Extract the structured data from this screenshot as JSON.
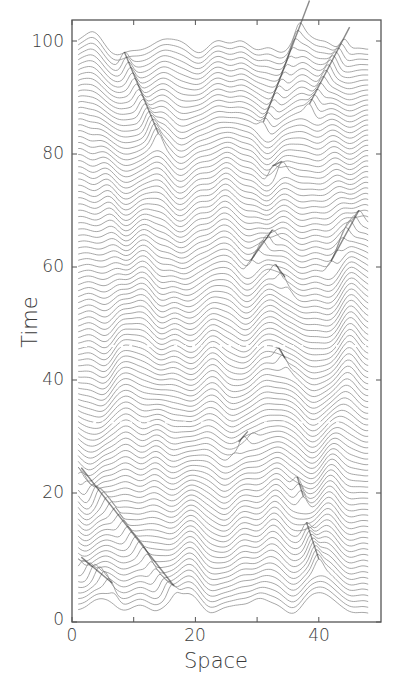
{
  "chart_data": {
    "type": "line",
    "subtype": "waterfall",
    "title": "",
    "xlabel": "Space",
    "ylabel": "Time",
    "xlim": [
      0,
      50
    ],
    "ylim": [
      0,
      103
    ],
    "xticks": [
      0,
      10,
      20,
      30,
      40
    ],
    "xtick_labels": [
      "0",
      "20",
      "40"
    ],
    "xtick_labeled_values": [
      0,
      20,
      40
    ],
    "yticks": [
      0,
      20,
      40,
      60,
      80,
      100
    ],
    "ytick_labels": [
      "0",
      "20",
      "40",
      "60",
      "80",
      "100"
    ],
    "grid": false,
    "legend": null,
    "n_traces": 100,
    "trace_spacing_time": 1,
    "trace_x_range": [
      1,
      48
    ],
    "trace_color": "#8a8a8a",
    "soliton_color": "#2a2a2a",
    "frame_color": "#555555",
    "waves": [
      {
        "name": "crest-a",
        "x0": 5.5,
        "velocity": 0.0,
        "amplitude": 1.4,
        "width": 1.6
      },
      {
        "name": "crest-b",
        "x0": 14,
        "velocity": 0.0,
        "amplitude": 1.3,
        "width": 1.8
      },
      {
        "name": "crest-c",
        "x0": 25,
        "velocity": 0.0,
        "amplitude": 1.4,
        "width": 1.7
      },
      {
        "name": "crest-d",
        "x0": 32,
        "velocity": 0.0,
        "amplitude": 1.5,
        "width": 1.7
      },
      {
        "name": "crest-e",
        "x0": 43,
        "velocity": 0.0,
        "amplitude": 1.4,
        "width": 1.7
      }
    ],
    "solitons": [
      {
        "name": "soliton-1",
        "t_start": 7.5,
        "t_end": 1.5,
        "x_start": 1.5,
        "x_end": 6.5,
        "note": "dark diagonal track near bottom-left"
      },
      {
        "name": "soliton-2",
        "t_start": 23.5,
        "t_end": 0.5,
        "x_start": 1.5,
        "x_end": 16.5,
        "note": "long dark diagonal from (1,24) to (16.5,0)"
      },
      {
        "name": "soliton-3",
        "t_start": 97,
        "t_end": 80,
        "x_start": 8.5,
        "x_end": 14,
        "note": "faint diagonal track upper-left"
      },
      {
        "name": "soliton-4",
        "t_start": 13,
        "t_end": 4,
        "x_start": 38,
        "x_end": 40,
        "note": "short dark track near x=39"
      },
      {
        "name": "soliton-5",
        "t_start": 21,
        "t_end": 18,
        "x_start": 36.5,
        "x_end": 37.5
      },
      {
        "name": "soliton-6",
        "t_start": 57,
        "t_end": 55.5,
        "x_start": 33,
        "x_end": 34.5
      },
      {
        "name": "soliton-7",
        "t_start": 42,
        "t_end": 40.5,
        "x_start": 33.5,
        "x_end": 34.5
      },
      {
        "name": "soliton-8",
        "t_start": 60,
        "t_end": 64,
        "x_start": 29,
        "x_end": 32.5
      },
      {
        "name": "soliton-9",
        "t_start": 60,
        "t_end": 66,
        "x_start": 42,
        "x_end": 46.5
      },
      {
        "name": "soliton-10",
        "t_start": 85,
        "t_end": 103,
        "x_start": 31,
        "x_end": 38.5
      },
      {
        "name": "soliton-11",
        "t_start": 86,
        "t_end": 101,
        "x_start": 38.5,
        "x_end": 45
      },
      {
        "name": "soliton-12",
        "t_start": 27.5,
        "t_end": 28.5,
        "x_start": 27,
        "x_end": 28.5
      },
      {
        "name": "soliton-13",
        "t_start": 77,
        "t_end": 76,
        "x_start": 32.5,
        "x_end": 34
      }
    ],
    "dashed_gaps": [
      {
        "time": 32.5,
        "note": "faint dotted break across traces"
      },
      {
        "time": 46,
        "note": "faint dotted break across traces"
      }
    ]
  },
  "axes": {
    "xlabel": "Space",
    "ylabel": "Time",
    "x_tick_labels": [
      {
        "value": 0,
        "label": "0"
      },
      {
        "value": 20,
        "label": "20"
      },
      {
        "value": 40,
        "label": "40"
      }
    ],
    "y_tick_labels": [
      {
        "value": 0,
        "label": "0"
      },
      {
        "value": 20,
        "label": "20"
      },
      {
        "value": 40,
        "label": "40"
      },
      {
        "value": 60,
        "label": "60"
      },
      {
        "value": 80,
        "label": "80"
      },
      {
        "value": 100,
        "label": "100"
      }
    ]
  }
}
